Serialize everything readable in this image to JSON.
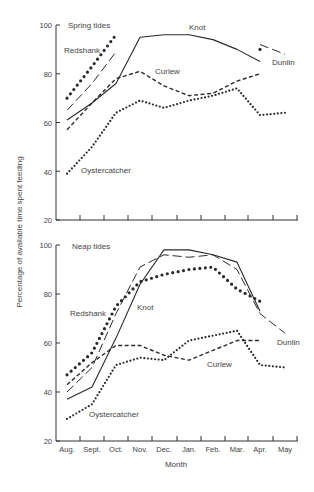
{
  "chart_data": [
    {
      "type": "line",
      "title": "Spring tides",
      "xlabel": "Month",
      "ylabel": "Percentage of available time spent feeding",
      "ylim": [
        20,
        100
      ],
      "yticks": [
        20,
        40,
        60,
        80,
        100
      ],
      "categories": [
        "Aug.",
        "Sept.",
        "Oct.",
        "Nov.",
        "Dec.",
        "Jan.",
        "Feb.",
        "Mar.",
        "Apr.",
        "May"
      ],
      "series": [
        {
          "name": "Redshank",
          "style": "heavy-dotted",
          "values": [
            70,
            83,
            96,
            null,
            null,
            null,
            null,
            null,
            90,
            null
          ]
        },
        {
          "name": "Dunlin",
          "style": "long-dash",
          "values": [
            65,
            76,
            89,
            null,
            null,
            null,
            null,
            null,
            92,
            88
          ]
        },
        {
          "name": "Knot",
          "style": "solid",
          "values": [
            61,
            68,
            76,
            95,
            96,
            96,
            94,
            90,
            85,
            null
          ]
        },
        {
          "name": "Curlew",
          "style": "dashed",
          "values": [
            57,
            68,
            78,
            81,
            75,
            71,
            72,
            77,
            80,
            null
          ]
        },
        {
          "name": "Oystercatcher",
          "style": "dotted",
          "values": [
            39,
            50,
            64,
            69,
            66,
            69,
            71,
            74,
            63,
            64
          ]
        }
      ],
      "grid": false,
      "legend": "inline labels"
    },
    {
      "type": "line",
      "title": "Neap tides",
      "xlabel": "Month",
      "ylabel": "Percentage of available time spent feeding",
      "ylim": [
        20,
        100
      ],
      "yticks": [
        20,
        40,
        60,
        80,
        100
      ],
      "categories": [
        "Aug.",
        "Sept.",
        "Oct.",
        "Nov.",
        "Dec.",
        "Jan.",
        "Feb.",
        "Mar.",
        "Apr.",
        "May"
      ],
      "series": [
        {
          "name": "Redshank",
          "style": "heavy-dotted",
          "values": [
            47,
            56,
            75,
            85,
            88,
            90,
            91,
            82,
            77,
            null
          ]
        },
        {
          "name": "Dunlin",
          "style": "long-dash",
          "values": [
            40,
            50,
            72,
            91,
            96,
            95,
            96,
            90,
            72,
            64
          ]
        },
        {
          "name": "Knot",
          "style": "solid",
          "values": [
            37,
            42,
            62,
            84,
            98,
            98,
            96,
            93,
            73,
            null
          ]
        },
        {
          "name": "Curlew",
          "style": "dashed",
          "values": [
            43,
            52,
            59,
            59,
            55,
            53,
            57,
            61,
            61,
            null
          ]
        },
        {
          "name": "Oystercatcher",
          "style": "dotted",
          "values": [
            29,
            35,
            51,
            54,
            53,
            61,
            63,
            65,
            51,
            50
          ]
        }
      ],
      "grid": false,
      "legend": "inline labels"
    }
  ],
  "labels": {
    "ylabel": "Percentage of available time spent feeding",
    "xlabel": "Month",
    "top_title": "Spring tides",
    "bottom_title": "Neap tides",
    "months": [
      "Aug.",
      "Sept.",
      "Oct.",
      "Nov.",
      "Dec.",
      "Jan.",
      "Feb.",
      "Mar.",
      "Apr.",
      "May"
    ],
    "yticks": [
      "20",
      "40",
      "60",
      "80",
      "100"
    ],
    "top_series_labels": {
      "redshank": "Redshank",
      "knot": "Knot",
      "curlew": "Curlew",
      "dunlin": "Dunlin",
      "oystercatcher": "Oystercatcher"
    },
    "bottom_series_labels": {
      "redshank": "Redshank",
      "knot": "Knot",
      "curlew": "Curlew",
      "dunlin": "Dunlin",
      "oystercatcher": "Oystercatcher"
    }
  }
}
